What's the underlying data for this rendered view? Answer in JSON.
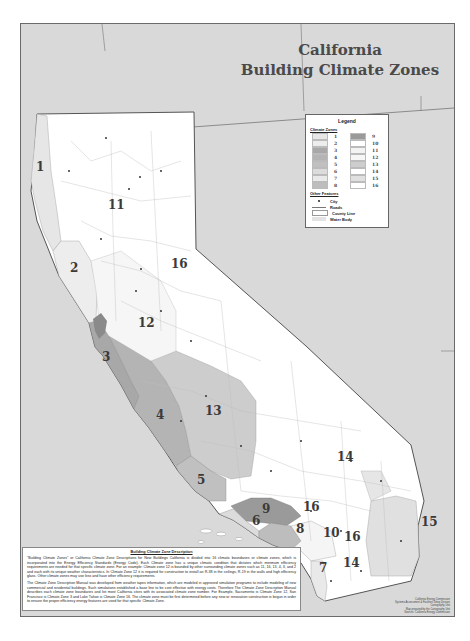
{
  "title": {
    "line1": "California",
    "line2": "Building Climate Zones"
  },
  "legend": {
    "title": "Legend",
    "climate_zones_header": "Climate Zones",
    "zones": [
      {
        "label": "1",
        "color": "#e6e6e6"
      },
      {
        "label": "9",
        "color": "#9a9a9a"
      },
      {
        "label": "2",
        "color": "#ededed"
      },
      {
        "label": "10",
        "color": "#ffffff"
      },
      {
        "label": "3",
        "color": "#a8a8a8"
      },
      {
        "label": "11",
        "color": "#f3f3f3"
      },
      {
        "label": "4",
        "color": "#b4b4b4"
      },
      {
        "label": "12",
        "color": "#f6f6f6"
      },
      {
        "label": "5",
        "color": "#c0c0c0"
      },
      {
        "label": "13",
        "color": "#cdcdcd"
      },
      {
        "label": "6",
        "color": "#dcdcdc"
      },
      {
        "label": "14",
        "color": "#ffffff"
      },
      {
        "label": "7",
        "color": "#e9e9e9"
      },
      {
        "label": "15",
        "color": "#e0e0e0"
      },
      {
        "label": "8",
        "color": "#bdbdbd"
      },
      {
        "label": "16",
        "color": "#ffffff"
      }
    ],
    "other_features_header": "Other Features",
    "other_features": [
      {
        "label": "City",
        "symbol": "dot"
      },
      {
        "label": "Roads",
        "symbol": "line"
      },
      {
        "label": "County Line",
        "symbol": "box"
      },
      {
        "label": "Water Body",
        "symbol": "fill"
      }
    ]
  },
  "map": {
    "zone_labels": [
      {
        "label": "1",
        "x": 35,
        "y": 170,
        "size": 12
      },
      {
        "label": "11",
        "x": 107,
        "y": 208,
        "size": 12
      },
      {
        "label": "2",
        "x": 69,
        "y": 271,
        "size": 12
      },
      {
        "label": "16",
        "x": 170,
        "y": 267,
        "size": 12
      },
      {
        "label": "12",
        "x": 137,
        "y": 326,
        "size": 12
      },
      {
        "label": "3",
        "x": 101,
        "y": 360,
        "size": 12
      },
      {
        "label": "13",
        "x": 204,
        "y": 414,
        "size": 12
      },
      {
        "label": "4",
        "x": 155,
        "y": 418,
        "size": 12
      },
      {
        "label": "5",
        "x": 196,
        "y": 483,
        "size": 12
      },
      {
        "label": "14",
        "x": 336,
        "y": 460,
        "size": 12
      },
      {
        "label": "9",
        "x": 261,
        "y": 512,
        "size": 12
      },
      {
        "label": "16",
        "x": 302,
        "y": 510,
        "size": 12
      },
      {
        "label": "6",
        "x": 251,
        "y": 524,
        "size": 12
      },
      {
        "label": "8",
        "x": 295,
        "y": 532,
        "size": 12
      },
      {
        "label": "10",
        "x": 322,
        "y": 536,
        "size": 12
      },
      {
        "label": "16",
        "x": 343,
        "y": 540,
        "size": 12
      },
      {
        "label": "15",
        "x": 420,
        "y": 525,
        "size": 12
      },
      {
        "label": "7",
        "x": 318,
        "y": 571,
        "size": 12
      },
      {
        "label": "14",
        "x": 342,
        "y": 566,
        "size": 12
      }
    ]
  },
  "description": {
    "title": "Building Climate Zone Description",
    "paragraph1": "\"Building Climate Zones\" or California Climate Zone Descriptions for New Buildings California is divided into 16 climatic boundaries or climate zones, which is incorporated into the Energy Efficiency Standards (Energy Code). Each Climate zone has a unique climatic condition that dictates which minimum efficiency requirements are needed for that specific climate zone. For an example: Climate zone 12 is bounded by other surrounding climate zones such as 11, 16, 13, 4, 3, and 2 and each with its unique weather characteristics. In Climate Zone 12 it is required for construction to install an R-38 in the ceilings, R-19 in the walls and high efficiency glass. Other climate zones may use less and have other efficiency requirements.",
    "paragraph2": "The Climate Zone Description Manual was developed from weather tapes information, which are modeled in approved simulation programs to include modeling of new commercial and residential buildings. Such simulations established a base line to be cost effective with energy costs. Therefore The Climate Zone Description Manual describes each climate zone boundaries and list most California cities with its associated climate zone number. For Example, Sacramento is Climate Zone 12, San Francisco is Climate Zone 3 and Lake Tahoe is Climate Zone 16. The climate zone must be first determined before any new or renovation construction is begun in order to ensure the proper efficiency energy features are used for that specific Climate Zone."
  },
  "credits": {
    "line1": "California Energy Commission",
    "line2": "Systems Assessment & Facilities Siting Division",
    "line3": "Cartography Unit",
    "line4": "Map prepared by the Cartography Unit",
    "line5": "Sources: California Energy Commission"
  },
  "colors": {
    "background": "#d9d9d9",
    "state_interior": "#ffffff",
    "zone_dark": "#9a9a9a",
    "zone_mid": "#b8b8b8",
    "zone_light": "#cdcdcd",
    "zone_pale": "#e8e8e8",
    "border": "#6a6a6a",
    "title_text": "#4a4a4a"
  }
}
